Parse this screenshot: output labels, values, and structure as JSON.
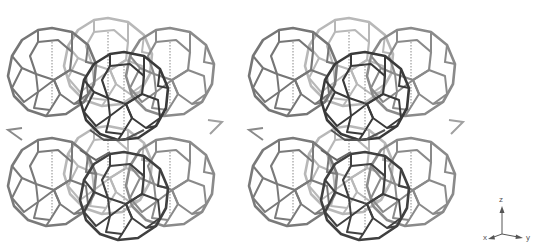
{
  "figure": {
    "panels": [
      {
        "id": "left",
        "label": "stereo-view-left"
      },
      {
        "id": "right",
        "label": "stereo-view-right"
      }
    ],
    "colors": {
      "front_edges": "#3a3a3a",
      "mid_edges": "#6e6e6e",
      "back_edges": "#b4b4b4",
      "dotted_axes": "#888888",
      "background": "#ffffff"
    }
  },
  "axes_triad": {
    "z_label": "z",
    "x_label": "x",
    "y_label": "y"
  }
}
